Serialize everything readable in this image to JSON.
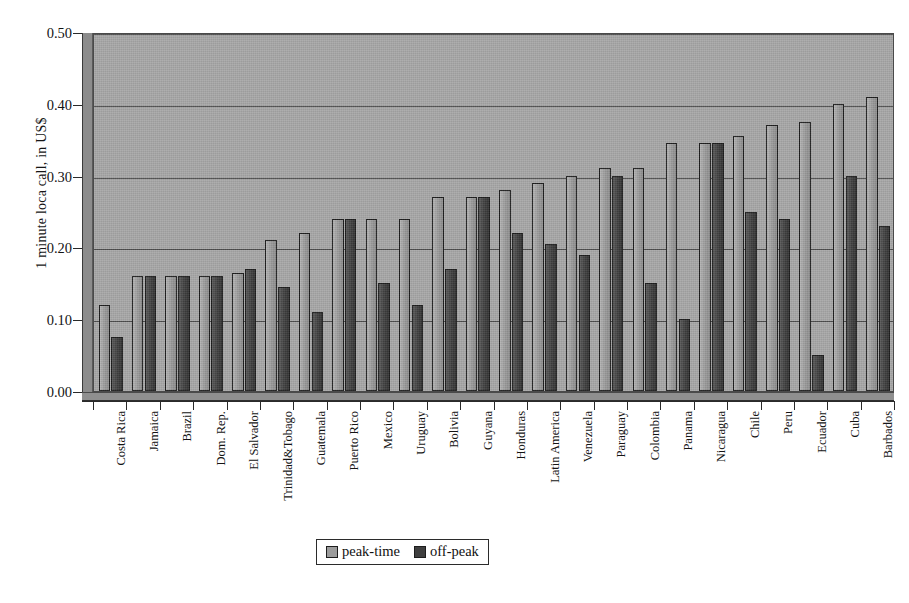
{
  "chart_data": {
    "type": "bar",
    "title": "",
    "subtitle": "",
    "xlabel": "",
    "ylabel": "1 minute loca call, in US$",
    "ylim": [
      0.0,
      0.5
    ],
    "ytick_labels": [
      "0.00",
      "0.10",
      "0.20",
      "0.30",
      "0.40",
      "0.50"
    ],
    "ytick_values": [
      0.0,
      0.1,
      0.2,
      0.3,
      0.4,
      0.5
    ],
    "grid": "horizontal",
    "legend_position": "bottom-center",
    "categories": [
      "Costa Rica",
      "Jamaica",
      "Brazil",
      "Dom. Rep.",
      "El Salvador",
      "Trinidad&Tobago",
      "Guatemala",
      "Puerto Rico",
      "Mexico",
      "Uruguay",
      "Bolivia",
      "Guyana",
      "Honduras",
      "Latin America",
      "Venezuela",
      "Paraguay",
      "Colombia",
      "Panama",
      "Nicaragua",
      "Chile",
      "Peru",
      "Ecuador",
      "Cuba",
      "Barbados"
    ],
    "series": [
      {
        "name": "peak-time",
        "color": "#9c9c9c",
        "values": [
          0.12,
          0.16,
          0.16,
          0.16,
          0.165,
          0.21,
          0.22,
          0.24,
          0.24,
          0.24,
          0.27,
          0.27,
          0.28,
          0.29,
          0.3,
          0.31,
          0.31,
          0.345,
          0.345,
          0.355,
          0.37,
          0.375,
          0.4,
          0.41
        ]
      },
      {
        "name": "off-peak",
        "color": "#3f3f3f",
        "values": [
          0.075,
          0.16,
          0.16,
          0.16,
          0.17,
          0.145,
          0.11,
          0.24,
          0.15,
          0.12,
          0.17,
          0.27,
          0.22,
          0.205,
          0.19,
          0.3,
          0.15,
          0.1,
          0.345,
          0.25,
          0.24,
          0.05,
          0.3,
          0.23
        ]
      }
    ]
  },
  "legend": {
    "entries": [
      {
        "label": "peak-time"
      },
      {
        "label": "off-peak"
      }
    ]
  }
}
